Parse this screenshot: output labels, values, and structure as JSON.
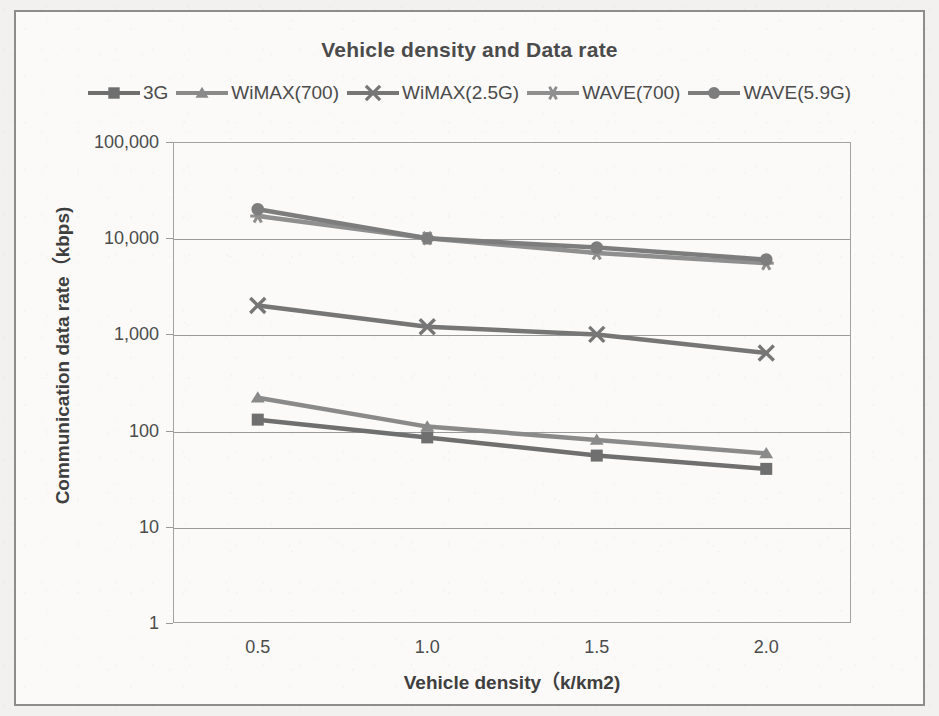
{
  "chart_data": {
    "type": "line",
    "title": "Vehicle density and Data rate",
    "xlabel": "Vehicle density（k/km2)",
    "ylabel": "Communication data rate（kbps)",
    "x": [
      0.5,
      1.0,
      1.5,
      2.0
    ],
    "x_tick_labels": [
      "0.5",
      "1.0",
      "1.5",
      "2.0"
    ],
    "y_scale": "log",
    "ylim": [
      1,
      100000
    ],
    "y_ticks": [
      1,
      10,
      100,
      1000,
      10000,
      100000
    ],
    "y_tick_labels": [
      "1",
      "10",
      "100",
      "1,000",
      "10,000",
      "100,000"
    ],
    "grid": "horizontal",
    "legend_position": "top",
    "series": [
      {
        "name": "3G",
        "marker": "square",
        "color": "#6f6f6f",
        "values": [
          130,
          85,
          55,
          40
        ]
      },
      {
        "name": "WiMAX(700)",
        "marker": "triangle",
        "color": "#8a8a8a",
        "values": [
          220,
          110,
          80,
          58
        ]
      },
      {
        "name": "WiMAX(2.5G)",
        "marker": "x",
        "color": "#767676",
        "values": [
          2000,
          1200,
          1000,
          640
        ]
      },
      {
        "name": "WAVE(700)",
        "marker": "asterisk",
        "color": "#8f8f8f",
        "values": [
          17000,
          10000,
          7000,
          5500
        ]
      },
      {
        "name": "WAVE(5.9G)",
        "marker": "circle",
        "color": "#7d7d7d",
        "values": [
          20000,
          10000,
          8000,
          6000
        ]
      }
    ]
  }
}
